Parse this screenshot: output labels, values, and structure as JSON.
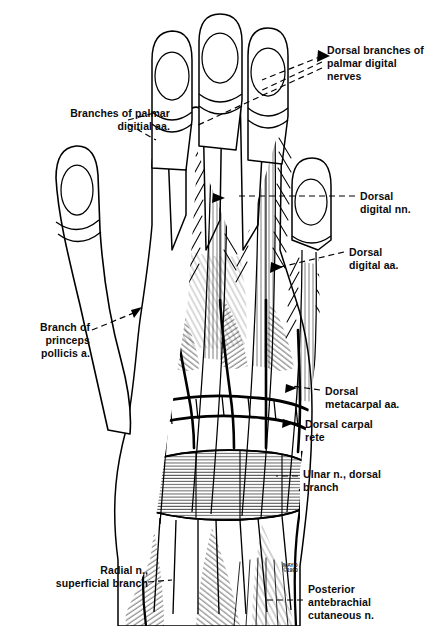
{
  "figure": {
    "view": "dorsal view of right hand",
    "background_color": "#ffffff",
    "ink_color": "#000000",
    "watermark": "MAYO\n©1990"
  },
  "labels": [
    {
      "id": "dorsal-branches-palmar-digital-nerves",
      "text": "Dorsal branches of\npalmar digital\nnerves",
      "align": "left",
      "x": 327,
      "y": 44
    },
    {
      "id": "branches-palmar-digitial-aa",
      "text": "Branches of palmar\ndigitial aa.",
      "align": "right",
      "x": 25,
      "y": 107
    },
    {
      "id": "dorsal-digital-nn",
      "text": "Dorsal\ndigital nn.",
      "align": "left",
      "x": 360,
      "y": 190
    },
    {
      "id": "dorsal-digital-aa",
      "text": "Dorsal\ndigital aa.",
      "align": "left",
      "x": 349,
      "y": 246
    },
    {
      "id": "branch-princeps-pollicis-a",
      "text": "Branch of\nprinceps\npollicis a.",
      "align": "right",
      "x": 14,
      "y": 321
    },
    {
      "id": "dorsal-metacarpal-aa",
      "text": "Dorsal\nmetacarpal aa.",
      "align": "left",
      "x": 325,
      "y": 385
    },
    {
      "id": "dorsal-carpal-rete",
      "text": "Dorsal carpal\nrete",
      "align": "left",
      "x": 305,
      "y": 418
    },
    {
      "id": "ulnar-n-dorsal-branch",
      "text": "Ulnar n., dorsal\nbranch",
      "align": "left",
      "x": 303,
      "y": 468
    },
    {
      "id": "radial-n-superficial-branch",
      "text": "Radial n.,\nsuperficial branch",
      "align": "right",
      "x": 40,
      "y": 570
    },
    {
      "id": "posterior-antebrachial-cutaneous-n",
      "text": "Posterior\nantebrachial\ncutaneous n.",
      "align": "left",
      "x": 308,
      "y": 585
    }
  ]
}
